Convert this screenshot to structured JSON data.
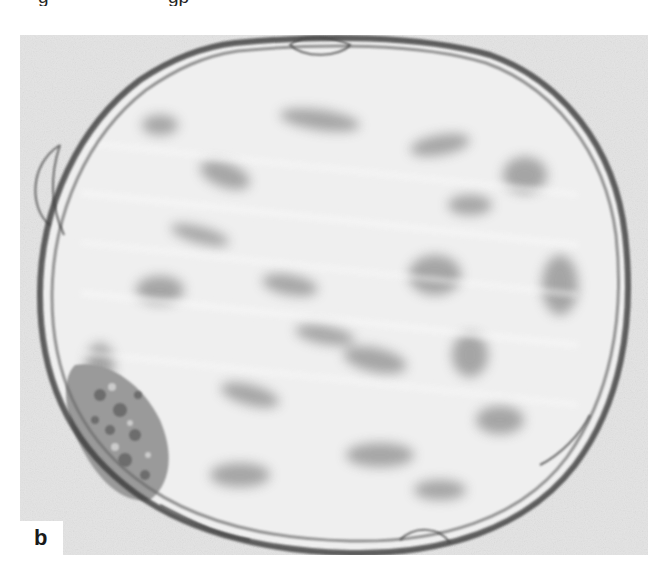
{
  "figure": {
    "panel_label": "b",
    "caption_fragment_left": "g",
    "caption_fragment_right": "gp",
    "colors": {
      "background": "#e6e6e6",
      "blastocoel": "#f0f0f0",
      "membrane": "#3a3a3a",
      "cell_mass": "#8a8a8a",
      "label_box": "#ffffff",
      "label_text": "#1a1a1a"
    }
  }
}
